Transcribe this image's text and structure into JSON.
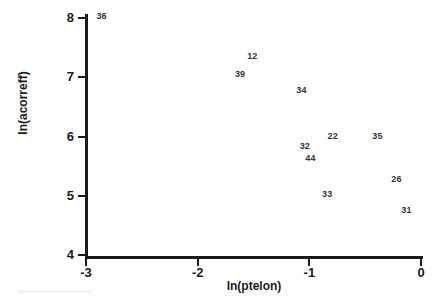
{
  "chart_data": {
    "type": "scatter",
    "title": "",
    "xlabel": "ln(ptelon)",
    "ylabel": "ln(acorreff)",
    "xlim": [
      -3.2,
      0.1
    ],
    "ylim": [
      3.85,
      8.15
    ],
    "xticks": [
      "-3",
      "-2",
      "-1",
      "0"
    ],
    "xtick_values": [
      -3,
      -2,
      -1,
      0
    ],
    "yticks": [
      "8",
      "7",
      "6",
      "5",
      "4"
    ],
    "ytick_values": [
      8,
      7,
      6,
      5,
      4
    ],
    "grid": false,
    "legend": "none",
    "marker_style": "case-number-text",
    "points": [
      {
        "label": "36",
        "x": -2.86,
        "y": 8.03
      },
      {
        "label": "12",
        "x": -1.51,
        "y": 7.36
      },
      {
        "label": "39",
        "x": -1.62,
        "y": 7.06
      },
      {
        "label": "34",
        "x": -1.07,
        "y": 6.78
      },
      {
        "label": "22",
        "x": -0.79,
        "y": 6.01
      },
      {
        "label": "35",
        "x": -0.39,
        "y": 6.01
      },
      {
        "label": "32",
        "x": -1.04,
        "y": 5.84
      },
      {
        "label": "44",
        "x": -0.99,
        "y": 5.64
      },
      {
        "label": "26",
        "x": -0.22,
        "y": 5.28
      },
      {
        "label": "33",
        "x": -0.84,
        "y": 5.03
      },
      {
        "label": "31",
        "x": -0.13,
        "y": 4.76
      }
    ]
  },
  "colors": {
    "axis": "#1a1a1a",
    "label_text": "#333333",
    "background": "#ffffff"
  }
}
